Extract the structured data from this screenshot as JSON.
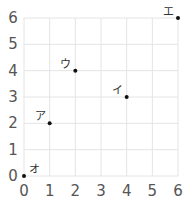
{
  "chart_data": {
    "type": "scatter",
    "title": "",
    "xlabel": "",
    "ylabel": "",
    "xlim": [
      0,
      6
    ],
    "ylim": [
      0,
      6
    ],
    "grid": true,
    "x_ticks": [
      "0",
      "1",
      "2",
      "3",
      "4",
      "5",
      "6"
    ],
    "y_ticks": [
      "0",
      "1",
      "2",
      "3",
      "4",
      "5",
      "6"
    ],
    "points": [
      {
        "label": "ア",
        "x": 1,
        "y": 2
      },
      {
        "label": "イ",
        "x": 4,
        "y": 3
      },
      {
        "label": "ウ",
        "x": 2,
        "y": 4
      },
      {
        "label": "エ",
        "x": 6,
        "y": 6
      },
      {
        "label": "オ",
        "x": 0,
        "y": 0
      }
    ],
    "colors": {
      "point": "#111111",
      "grid": "#e4e4e4",
      "tick_text": "#555555"
    }
  }
}
